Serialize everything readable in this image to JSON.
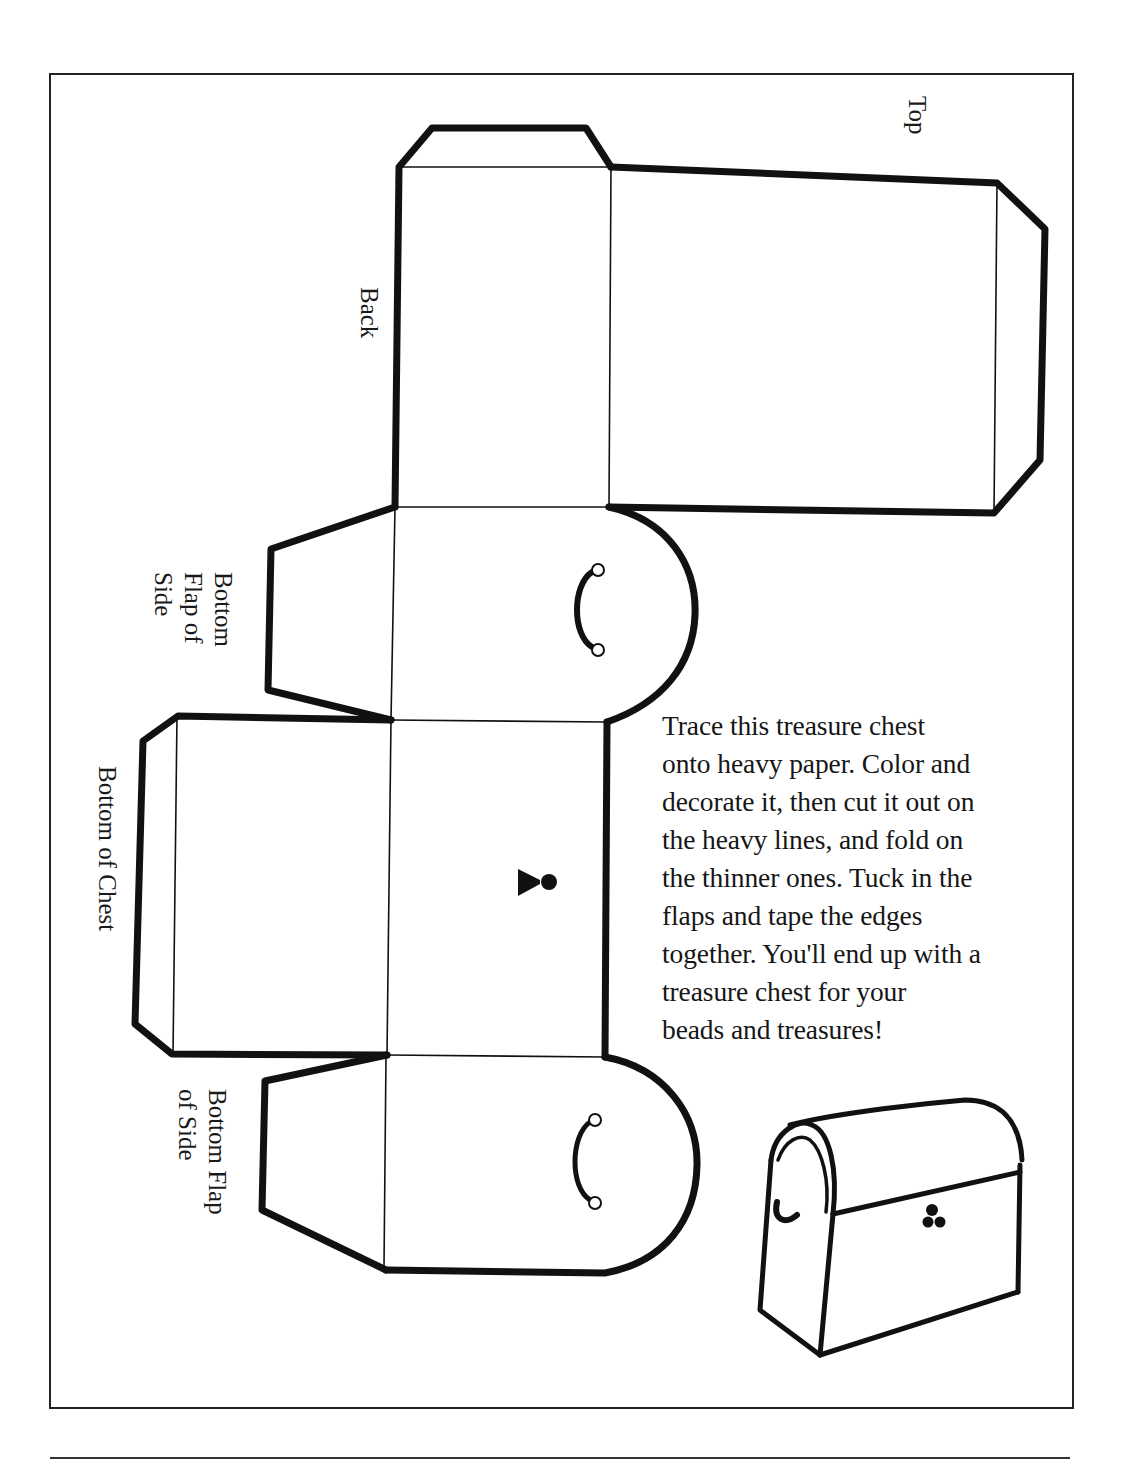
{
  "document": {
    "title": "Treasure chest cut-out template",
    "labels": {
      "top": "Top",
      "back": "Back",
      "bottom_flap_of_side_1": "Bottom\nFlap of\nSide",
      "bottom_of_chest": "Bottom of Chest",
      "bottom_flap_of_side_2": "Bottom Flap\nof Side"
    },
    "instructions_lines": [
      "Trace this treasure chest",
      "onto heavy paper. Color and",
      "decorate it, then cut it out on",
      "the heavy lines, and fold on",
      "the thinner ones. Tuck in the",
      "flaps and tape the edges",
      "together. You'll end up with a",
      "treasure chest for your",
      "beads and treasures!"
    ],
    "icons": {
      "handle": "chest-handle-icon",
      "keyhole": "keyhole-icon",
      "illustration": "treasure-chest-illustration"
    },
    "colors": {
      "ink": "#111111",
      "paper": "#ffffff",
      "frame": "#222222"
    }
  }
}
